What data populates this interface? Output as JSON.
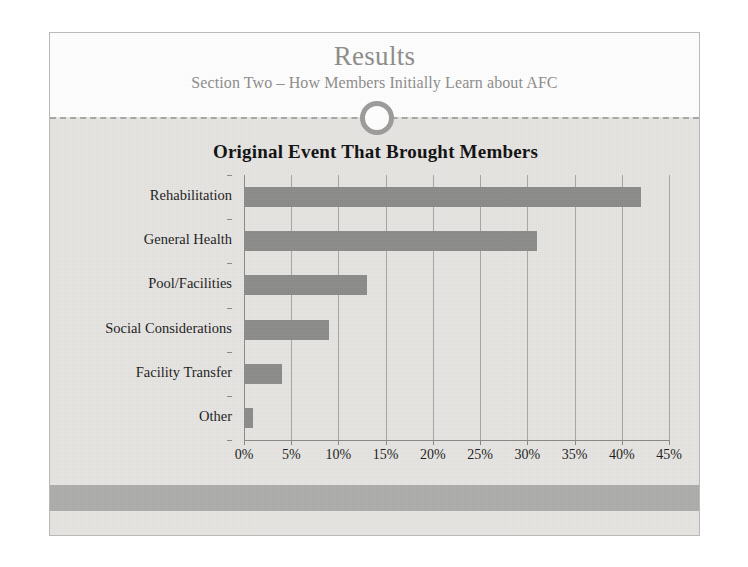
{
  "slide": {
    "title": "Results",
    "subtitle": "Section Two – How Members Initially Learn about AFC",
    "ornament": "circle-ornament",
    "colors": {
      "slide_background": "#e6e5e2",
      "header_background": "#ffffff",
      "footer_band": "#adadab",
      "title_text": "#8e8d8b",
      "bar_fill": "#8c8c8a",
      "gridline": "#a6a6a4",
      "axis": "#8a8a88",
      "body_text": "#1c1c1c"
    }
  },
  "chart_data": {
    "type": "bar",
    "orientation": "horizontal",
    "title": "Original Event That Brought Members",
    "xlabel": "",
    "ylabel": "",
    "categories": [
      "Rehabilitation",
      "General Health",
      "Pool/Facilities",
      "Social Considerations",
      "Facility Transfer",
      "Other"
    ],
    "values": [
      42,
      31,
      13,
      9,
      4,
      1
    ],
    "value_unit": "%",
    "xlim": [
      0,
      45
    ],
    "xticks": [
      0,
      5,
      10,
      15,
      20,
      25,
      30,
      35,
      40,
      45
    ],
    "xtick_labels": [
      "0%",
      "5%",
      "10%",
      "15%",
      "20%",
      "25%",
      "30%",
      "35%",
      "40%",
      "45%"
    ],
    "grid": "vertical",
    "legend": "none",
    "series": [
      {
        "name": "Original Event That Brought Members",
        "values": [
          42,
          31,
          13,
          9,
          4,
          1
        ]
      }
    ]
  }
}
